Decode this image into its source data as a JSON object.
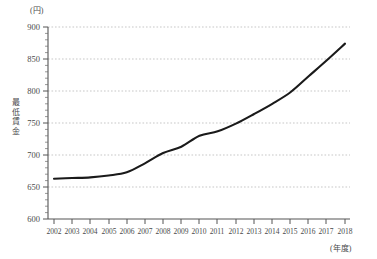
{
  "chart_data": {
    "type": "line",
    "title": "",
    "xlabel": "(年度)",
    "ylabel": "最低賃金",
    "yunit": "(円)",
    "ylim": [
      600,
      900
    ],
    "ytick_step": 50,
    "yminor_step": 10,
    "grid": true,
    "legend": "none",
    "x": [
      2002,
      2003,
      2004,
      2005,
      2006,
      2007,
      2008,
      2009,
      2010,
      2011,
      2012,
      2013,
      2014,
      2015,
      2016,
      2017,
      2018
    ],
    "categories": [
      "2002",
      "2003",
      "2004",
      "2005",
      "2006",
      "2007",
      "2008",
      "2009",
      "2010",
      "2011",
      "2012",
      "2013",
      "2014",
      "2015",
      "2016",
      "2017",
      "2018"
    ],
    "values": [
      663,
      664,
      665,
      668,
      673,
      687,
      703,
      713,
      730,
      737,
      749,
      764,
      780,
      798,
      823,
      848,
      874
    ],
    "series": [
      {
        "name": "最低賃金",
        "color": "#1a1a1a",
        "values": [
          663,
          664,
          665,
          668,
          673,
          687,
          703,
          713,
          730,
          737,
          749,
          764,
          780,
          798,
          823,
          848,
          874
        ]
      }
    ],
    "ytick_labels": [
      "900",
      "850",
      "800",
      "750",
      "700",
      "650",
      "600"
    ],
    "ytick_values": [
      900,
      850,
      800,
      750,
      700,
      650,
      600
    ],
    "axis_color": "#555555",
    "grid_color": "#b9b9b9",
    "line_color": "#1a1a1a"
  }
}
